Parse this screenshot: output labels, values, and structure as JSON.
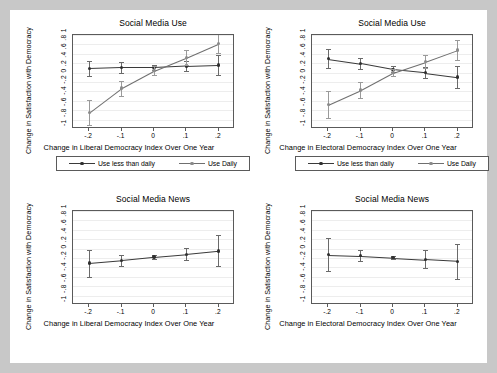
{
  "figure": {
    "background": "#c8c8c8",
    "panel_background": "#ffffff",
    "accent_dark": "#2f2f2f",
    "accent_light": "#8a8a8a"
  },
  "legend": {
    "series1_label": "Use less than daily",
    "series2_label": "Use Daily"
  },
  "axis": {
    "y_title": "Change in Satisfaction with Democracy",
    "y_ticklabels": "-1 -.8 -.6 -.4 -.2 0 .2 .4 .6 .8 1",
    "x_ticklabels": [
      "-.2",
      "-.1",
      "0",
      ".1",
      ".2"
    ],
    "x_title_liberal": "Change in Liberal Democracy Index Over One Year",
    "x_title_electoral": "Change in Electoral Democracy Index Over One Year"
  },
  "chart_data": [
    {
      "type": "line",
      "panel": "top-left",
      "title": "Social Media Use",
      "xlabel": "Change in Liberal Democracy Index Over One Year",
      "ylabel": "Change in Satisfaction with Democracy",
      "x": [
        -0.2,
        -0.1,
        0,
        0.1,
        0.2
      ],
      "xlim": [
        -0.25,
        0.25
      ],
      "ylim": [
        -1,
        1
      ],
      "yticks": [
        -1,
        -0.8,
        -0.6,
        -0.4,
        -0.2,
        0,
        0.2,
        0.4,
        0.6,
        0.8,
        1
      ],
      "grid": true,
      "legend_position": "below",
      "series": [
        {
          "name": "Use less than daily",
          "values": [
            0.29,
            0.31,
            0.31,
            0.34,
            0.36
          ],
          "ci_low": [
            0.13,
            0.2,
            0.25,
            0.23,
            0.15
          ],
          "ci_high": [
            0.45,
            0.42,
            0.37,
            0.45,
            0.57
          ]
        },
        {
          "name": "Use Daily",
          "values": [
            -0.65,
            -0.13,
            0.24,
            0.52,
            0.82
          ],
          "ci_low": [
            -0.92,
            -0.29,
            0.14,
            0.36,
            0.61
          ],
          "ci_high": [
            -0.38,
            0.03,
            0.34,
            0.68,
            1.03
          ]
        }
      ]
    },
    {
      "type": "line",
      "panel": "top-right",
      "title": "Social Media Use",
      "xlabel": "Change in Electoral Democracy Index Over One Year",
      "ylabel": "Change in Satisfaction with Democracy",
      "x": [
        -0.2,
        -0.1,
        0,
        0.1,
        0.2
      ],
      "xlim": [
        -0.25,
        0.25
      ],
      "ylim": [
        -1,
        1
      ],
      "yticks": [
        -1,
        -0.8,
        -0.6,
        -0.4,
        -0.2,
        0,
        0.2,
        0.4,
        0.6,
        0.8,
        1
      ],
      "grid": true,
      "legend_position": "below",
      "series": [
        {
          "name": "Use less than daily",
          "values": [
            0.5,
            0.4,
            0.27,
            0.2,
            0.11
          ],
          "ci_low": [
            0.3,
            0.28,
            0.21,
            0.08,
            -0.12
          ],
          "ci_high": [
            0.7,
            0.52,
            0.33,
            0.32,
            0.34
          ]
        },
        {
          "name": "Use Daily",
          "values": [
            -0.48,
            -0.17,
            0.2,
            0.43,
            0.68
          ],
          "ci_low": [
            -0.76,
            -0.33,
            0.12,
            0.29,
            0.47
          ],
          "ci_high": [
            -0.2,
            -0.01,
            0.28,
            0.57,
            0.89
          ]
        }
      ]
    },
    {
      "type": "line",
      "panel": "bottom-left",
      "title": "Social Media News",
      "xlabel": "Change in Liberal Democracy Index Over One Year",
      "ylabel": "Change in Satisfaction with Democracy",
      "x": [
        -0.2,
        -0.1,
        0,
        0.1,
        0.2
      ],
      "xlim": [
        -0.25,
        0.25
      ],
      "ylim": [
        -1,
        1
      ],
      "yticks": [
        -1,
        -0.8,
        -0.6,
        -0.4,
        -0.2,
        0,
        0.2,
        0.4,
        0.6,
        0.8,
        1
      ],
      "grid": true,
      "legend_position": "none",
      "series": [
        {
          "name": "Marginal effect",
          "values": [
            -0.11,
            -0.05,
            0.02,
            0.08,
            0.15
          ],
          "ci_low": [
            -0.4,
            -0.17,
            -0.03,
            -0.05,
            -0.18
          ],
          "ci_high": [
            0.18,
            0.07,
            0.07,
            0.21,
            0.48
          ]
        }
      ]
    },
    {
      "type": "line",
      "panel": "bottom-right",
      "title": "Social Media News",
      "xlabel": "Change in Electoral Democracy Index Over One Year",
      "ylabel": "Change in Satisfaction with Democracy",
      "x": [
        -0.2,
        -0.1,
        0,
        0.1,
        0.2
      ],
      "xlim": [
        -0.25,
        0.25
      ],
      "ylim": [
        -1,
        1
      ],
      "yticks": [
        -1,
        -0.8,
        -0.6,
        -0.4,
        -0.2,
        0,
        0.2,
        0.4,
        0.6,
        0.8,
        1
      ],
      "grid": true,
      "legend_position": "none",
      "series": [
        {
          "name": "Marginal effect",
          "values": [
            0.07,
            0.05,
            0.01,
            -0.03,
            -0.07
          ],
          "ci_low": [
            -0.28,
            -0.07,
            -0.03,
            -0.22,
            -0.44
          ],
          "ci_high": [
            0.42,
            0.17,
            0.05,
            0.16,
            0.3
          ]
        }
      ]
    }
  ]
}
